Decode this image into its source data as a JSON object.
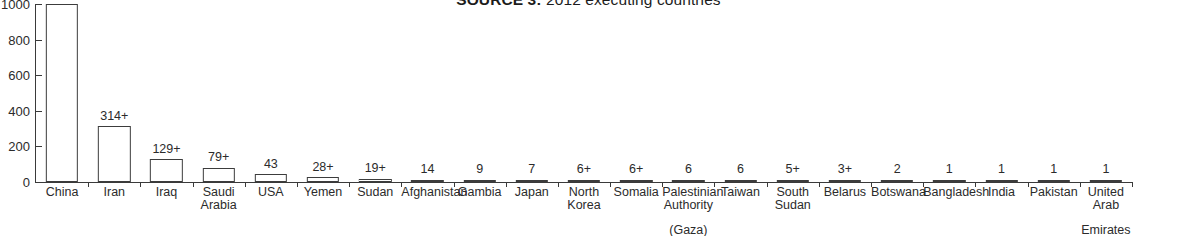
{
  "title": {
    "source_label": "SOURCE 3:",
    "text": " 2012 executing countries"
  },
  "colors": {
    "background": "#ffffff",
    "axis": "#3a3a3a",
    "bar_stroke": "#3c3c3c",
    "bar_fill": "#ffffff",
    "text": "#2b2b2b"
  },
  "y_axis": {
    "ticks": [
      "0",
      "200",
      "400",
      "600",
      "800",
      "1000"
    ],
    "min": 0,
    "max": 1000
  },
  "chart_data": {
    "type": "bar",
    "title": "SOURCE 3: 2012 executing countries",
    "xlabel": "",
    "ylabel": "",
    "ylim": [
      0,
      1000
    ],
    "grid": false,
    "legend": false,
    "categories": [
      "China",
      "Iran",
      "Iraq",
      "Saudi Arabia",
      "USA",
      "Yemen",
      "Sudan",
      "Afghanistan",
      "Gambia",
      "Japan",
      "North Korea",
      "Somalia",
      "Palestinian Authority (Gaza)",
      "Taiwan",
      "South Sudan",
      "Belarus",
      "Botswana",
      "Bangladesh",
      "India",
      "Pakistan",
      "United Arab Emirates"
    ],
    "values": [
      1000,
      314,
      129,
      79,
      43,
      28,
      19,
      14,
      9,
      7,
      6,
      6,
      6,
      6,
      5,
      3,
      2,
      1,
      1,
      1,
      1
    ],
    "data_labels": [
      "1000s+",
      "314+",
      "129+",
      "79+",
      "43",
      "28+",
      "19+",
      "14",
      "9",
      "7",
      "6+",
      "6+",
      "6",
      "6",
      "5+",
      "3+",
      "2",
      "1",
      "1",
      "1",
      "1"
    ],
    "category_label_lines": [
      [
        "China"
      ],
      [
        "Iran"
      ],
      [
        "Iraq"
      ],
      [
        "Saudi",
        "Arabia"
      ],
      [
        "USA"
      ],
      [
        "Yemen"
      ],
      [
        "Sudan"
      ],
      [
        "Afghanistan"
      ],
      [
        "Gambia"
      ],
      [
        "Japan"
      ],
      [
        "North",
        "Korea"
      ],
      [
        "Somalia"
      ],
      [
        "Palestinian",
        "Authority",
        "(Gaza)"
      ],
      [
        "Taiwan"
      ],
      [
        "South",
        "Sudan"
      ],
      [
        "Belarus"
      ],
      [
        "Botswana"
      ],
      [
        "Bangladesh"
      ],
      [
        "India"
      ],
      [
        "Pakistan"
      ],
      [
        "United",
        "Arab",
        "Emirates"
      ]
    ]
  }
}
